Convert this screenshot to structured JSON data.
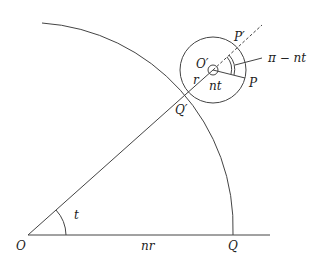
{
  "diagram": {
    "labels": {
      "O": "O",
      "Q": "Q",
      "O_prime": "O′",
      "Q_prime": "Q′",
      "P": "P",
      "P_prime": "P′",
      "r": "r",
      "t": "t",
      "nr": "nr",
      "nt": "nt",
      "pi_minus_nt": "π − nt"
    }
  }
}
